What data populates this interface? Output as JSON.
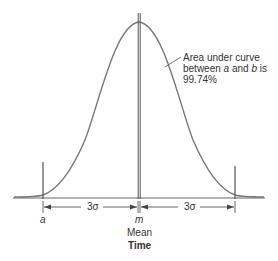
{
  "diagram": {
    "type": "normal-distribution",
    "annotation": {
      "line1": "Area under curve",
      "line2_pre": "between ",
      "a": "a",
      "line2_mid": " and ",
      "b": "b",
      "line2_post": " is",
      "line3": "99.74%"
    },
    "spans": {
      "left": "3σ",
      "right": "3σ"
    },
    "labels": {
      "a": "a",
      "m": "m",
      "mean": "Mean",
      "axis": "Time"
    }
  },
  "colors": {
    "curve": "#666666",
    "lines": "#555555",
    "text": "#333333"
  }
}
